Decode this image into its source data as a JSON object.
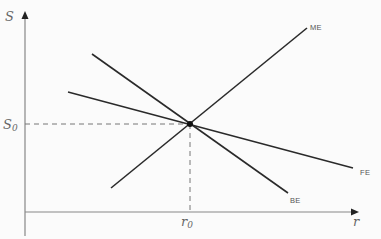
{
  "diagram": {
    "type": "economics-equilibrium",
    "axes": {
      "y": {
        "label": "S"
      },
      "x": {
        "label": "r"
      }
    },
    "equilibrium": {
      "s_label": "S",
      "s_sub": "0",
      "r_label": "r",
      "r_sub": "0"
    },
    "curves": [
      {
        "name": "ME",
        "label": "ME",
        "x1": 111,
        "y1": 188,
        "x2": 307,
        "y2": 28
      },
      {
        "name": "BE",
        "label": "BE",
        "x1": 92,
        "y1": 54,
        "x2": 288,
        "y2": 193
      },
      {
        "name": "FE",
        "label": "FE",
        "x1": 68,
        "y1": 92,
        "x2": 353,
        "y2": 168
      }
    ],
    "colors": {
      "axis": "#888888",
      "line": "#2a2a2a",
      "dash": "#777777",
      "background": "#fbfbfb"
    }
  }
}
